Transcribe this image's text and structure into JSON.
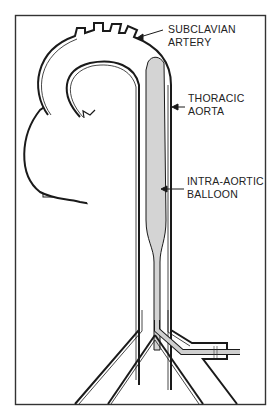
{
  "diagram": {
    "type": "anatomical-illustration",
    "labels": {
      "subclavian_line1": "SUBCLAVIAN",
      "subclavian_line2": "ARTERY",
      "thoracic_line1": "THORACIC",
      "thoracic_line2": "AORTA",
      "balloon_line1": "INTRA-AORTIC",
      "balloon_line2": "BALLOON"
    },
    "colors": {
      "background": "#ffffff",
      "stroke": "#1a1a1a",
      "balloon_fill": "#d4d4d4"
    },
    "structures": [
      "heart",
      "aortic-arch",
      "subclavian-artery",
      "thoracic-aorta",
      "intra-aortic-balloon",
      "iliac-bifurcation",
      "catheter"
    ]
  }
}
